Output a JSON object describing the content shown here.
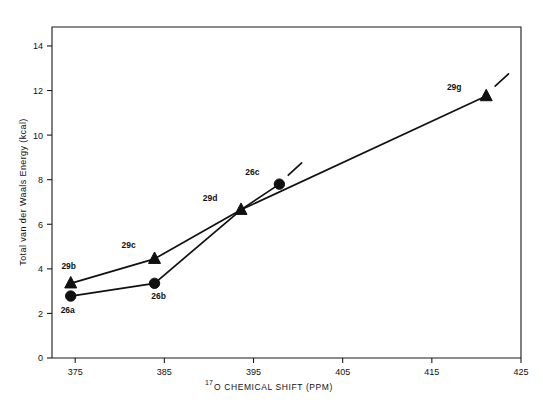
{
  "chart_data": {
    "type": "scatter",
    "title": "",
    "xlabel": "17O CHEMICAL SHIFT (PPM)",
    "xlabel_sup": "17",
    "xlabel_rest": "O CHEMICAL SHIFT (PPM)",
    "ylabel": "Total van der Waals Energy (kcal)",
    "xlim": [
      372.4,
      425
    ],
    "ylim": [
      0,
      14.85
    ],
    "xticks": [
      375,
      385,
      395,
      405,
      415,
      425
    ],
    "yticks": [
      0,
      2,
      4,
      6,
      8,
      10,
      12,
      14
    ],
    "grid": false,
    "legend": "none",
    "series": [
      {
        "name": "triangles",
        "marker": "triangle",
        "points": [
          {
            "label": "29b",
            "x": 374.5,
            "y": 3.35,
            "label_dx": -2,
            "label_dy": -14
          },
          {
            "label": "29c",
            "x": 383.9,
            "y": 4.45,
            "label_dx": -26,
            "label_dy": -11
          },
          {
            "label": "29d",
            "x": 393.6,
            "y": 6.65,
            "label_dx": -31,
            "label_dy": -9
          },
          {
            "label": "29g",
            "x": 421.1,
            "y": 11.75,
            "label_dx": -32,
            "label_dy": -6
          }
        ]
      },
      {
        "name": "circles",
        "marker": "circle",
        "points": [
          {
            "label": "26a",
            "x": 374.5,
            "y": 2.78,
            "label_dx": -3,
            "label_dy": 17
          },
          {
            "label": "26b",
            "x": 383.9,
            "y": 3.35,
            "label_dx": 4,
            "label_dy": 16
          },
          {
            "label": "26c",
            "x": 397.9,
            "y": 7.8,
            "label_dx": -27,
            "label_dy": -9
          }
        ]
      }
    ],
    "connections": [
      {
        "name": "triangle-path",
        "from": "29b",
        "to": "29c"
      },
      {
        "name": "triangle-path",
        "from": "29c",
        "to": "29d"
      },
      {
        "name": "circle-path",
        "from": "26a",
        "to": "26b"
      },
      {
        "name": "circle-path",
        "from": "26b",
        "to": "29d"
      },
      {
        "name": "branch-to-26c",
        "from": "29d",
        "to": "26c"
      },
      {
        "name": "branch-to-29g",
        "from": "29d",
        "to": "29g"
      }
    ],
    "tails": [
      {
        "name": "tail-26c",
        "x1": 398.9,
        "y1": 8.2,
        "x2": 400.4,
        "y2": 8.75
      },
      {
        "name": "tail-29g",
        "x1": 422.1,
        "y1": 12.2,
        "x2": 423.6,
        "y2": 12.75
      }
    ]
  }
}
